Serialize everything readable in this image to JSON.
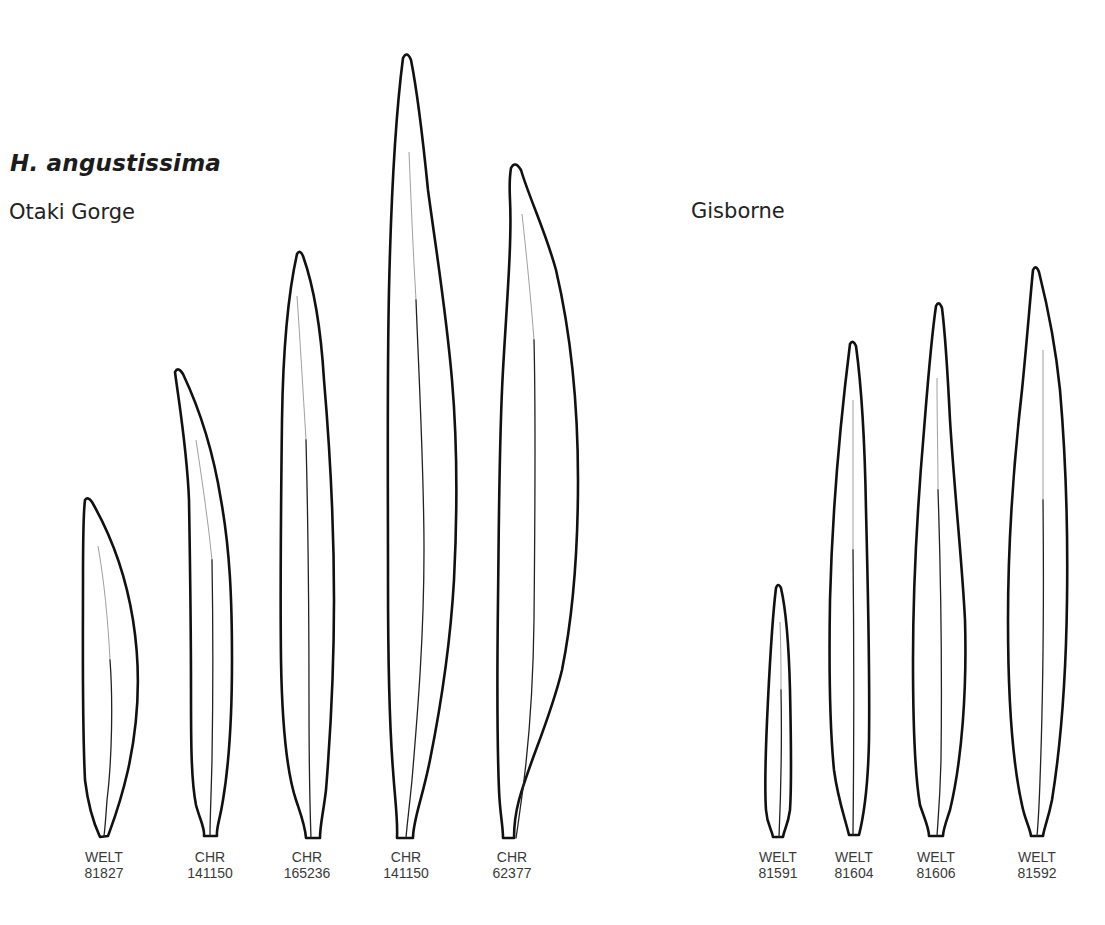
{
  "figure": {
    "species": "H. angustissima",
    "groups": [
      {
        "locality": "Otaki Gorge",
        "specimens": [
          {
            "herbarium": "WELT",
            "number": "81827"
          },
          {
            "herbarium": "CHR",
            "number": "141150"
          },
          {
            "herbarium": "CHR",
            "number": "165236"
          },
          {
            "herbarium": "CHR",
            "number": "141150"
          },
          {
            "herbarium": "CHR",
            "number": "62377"
          }
        ]
      },
      {
        "locality": "Gisborne",
        "specimens": [
          {
            "herbarium": "WELT",
            "number": "81591"
          },
          {
            "herbarium": "WELT",
            "number": "81604"
          },
          {
            "herbarium": "WELT",
            "number": "81606"
          },
          {
            "herbarium": "WELT",
            "number": "81592"
          }
        ]
      }
    ]
  },
  "colors": {
    "outline": "#111111",
    "label_text": "#3a3a3a",
    "background": "#ffffff"
  }
}
